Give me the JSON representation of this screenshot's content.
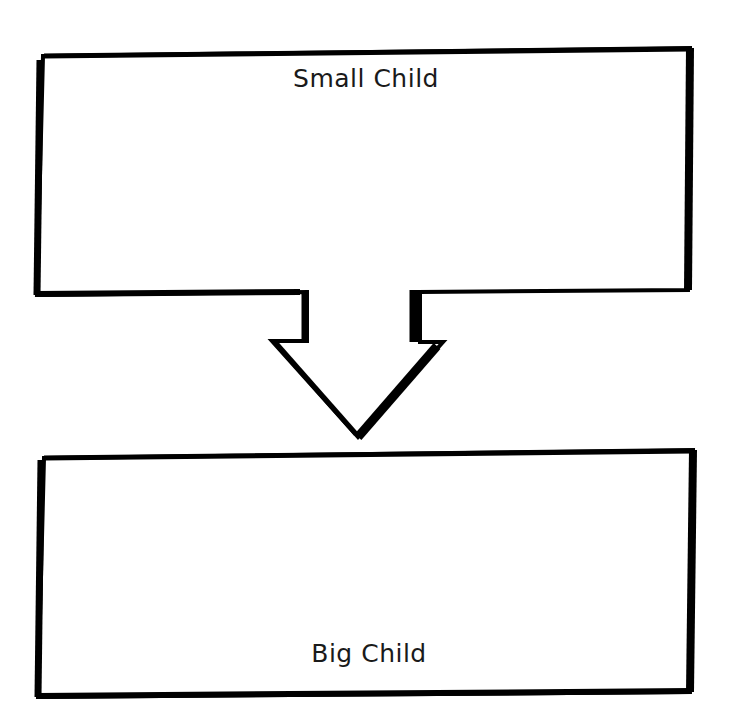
{
  "diagram": {
    "type": "flow",
    "direction": "top-to-bottom",
    "nodes": [
      {
        "id": "small-child",
        "label": "Small Child"
      },
      {
        "id": "big-child",
        "label": "Big Child"
      }
    ],
    "edges": [
      {
        "from": "small-child",
        "to": "big-child",
        "style": "block-arrow"
      }
    ],
    "colors": {
      "stroke": "#000000",
      "fill": "#ffffff",
      "text": "#1a1a1a"
    }
  }
}
